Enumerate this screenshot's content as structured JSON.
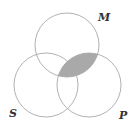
{
  "diagram": {
    "type": "venn",
    "sets": [
      {
        "id": "M",
        "label": "M"
      },
      {
        "id": "S",
        "label": "S"
      },
      {
        "id": "P",
        "label": "P"
      }
    ],
    "shaded_region": {
      "description": "M ∩ P",
      "sets": [
        "M",
        "P"
      ]
    },
    "colors": {
      "shade": "#a9a9a9",
      "stroke": "#a8a8a8",
      "label": "#333333"
    }
  }
}
